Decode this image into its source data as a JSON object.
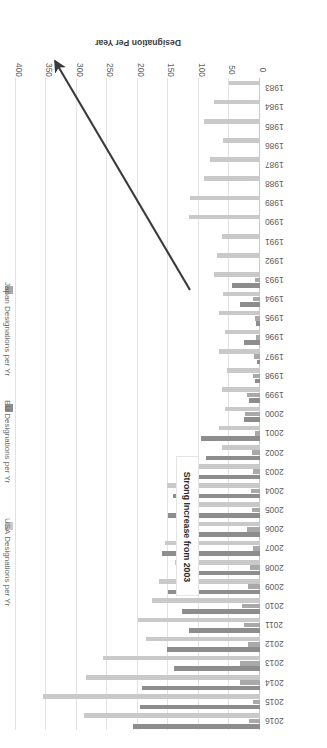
{
  "chart_data": {
    "type": "bar",
    "orientation": "horizontal",
    "title": "",
    "xlabel": "Designation Per Year",
    "ylabel": "",
    "xlim": [
      0,
      400
    ],
    "xticks": [
      0,
      50,
      100,
      150,
      200,
      250,
      300,
      350,
      400
    ],
    "grid": true,
    "legend_position": "right",
    "categories": [
      "2016",
      "2015",
      "2014",
      "2013",
      "2012",
      "2011",
      "2010",
      "2009",
      "2008",
      "2007",
      "2006",
      "2005",
      "2004",
      "2003",
      "2002",
      "2001",
      "2000",
      "1999",
      "1998",
      "1997",
      "1996",
      "1995",
      "1994",
      "1993",
      "1992",
      "1991",
      "1990",
      "1989",
      "1988",
      "1987",
      "1986",
      "1985",
      "1984",
      "1983"
    ],
    "series": [
      {
        "name": "EU Designations per Yr",
        "color": "#8d8d8d",
        "values": [
          209,
          197,
          194,
          141,
          153,
          116,
          128,
          151,
          125,
          161,
          136,
          151,
          142,
          116,
          89,
          96,
          26,
          18,
          9,
          5,
          26,
          6,
          32,
          46,
          0,
          0,
          0,
          0,
          0,
          0,
          0,
          0,
          0,
          0
        ]
      },
      {
        "name": "Japan Designations per Yr",
        "color": "#a9a9a9",
        "values": [
          18,
          12,
          32,
          33,
          20,
          26,
          29,
          19,
          16,
          12,
          21,
          13,
          14,
          11,
          13,
          9,
          25,
          22,
          11,
          10,
          7,
          9,
          12,
          8,
          0,
          0,
          0,
          0,
          0,
          0,
          0,
          0,
          0,
          0
        ]
      },
      {
        "name": "USA Designations per Yr",
        "color": "#c9c9c9",
        "values": [
          289,
          355,
          286,
          258,
          187,
          200,
          177,
          165,
          140,
          156,
          136,
          116,
          152,
          108,
          62,
          67,
          58,
          62,
          54,
          67,
          58,
          68,
          60,
          75,
          71,
          62,
          116,
          114,
          92,
          82,
          60,
          92,
          75,
          51
        ]
      }
    ],
    "annotations": [
      {
        "name": "strong-increase-callout",
        "text": "Strong Increase from 2003",
        "points_to": "2015"
      }
    ]
  },
  "axis": {
    "value_title": "Designation Per Year",
    "tick_labels": [
      "0",
      "50",
      "100",
      "150",
      "200",
      "250",
      "300",
      "350",
      "400"
    ]
  },
  "legend": {
    "items": [
      {
        "label": "USA Designations per Yr",
        "color": "#c9c9c9"
      },
      {
        "label": "EU Designations per Yr",
        "color": "#8d8d8d"
      },
      {
        "label": "Japan Designations per Yr",
        "color": "#a9a9a9"
      }
    ]
  },
  "annotation": {
    "label": "Strong Increase from 2003"
  }
}
